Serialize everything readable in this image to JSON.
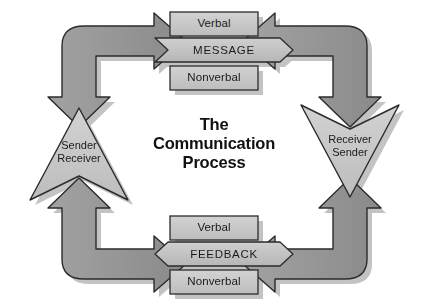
{
  "diagram": {
    "title_lines": [
      "The",
      "Communication",
      "Process"
    ],
    "title_text": "The Communication Process",
    "background_color": "#ffffff",
    "palette": {
      "light_fill": "#c9c9c9",
      "mid_fill": "#bdbdbd",
      "dark_fill": "#949494",
      "outline": "#2b2b2b",
      "shadow": "#b8b8b8",
      "text": "#1a1a1a"
    },
    "message_block": {
      "top_label": "Verbal",
      "band_label": "MESSAGE",
      "bottom_label": "Nonverbal",
      "direction": "right"
    },
    "feedback_block": {
      "top_label": "Verbal",
      "band_label": "FEEDBACK",
      "bottom_label": "Nonverbal",
      "direction": "left"
    },
    "left_node": {
      "line1": "Sender",
      "line2": "Receiver",
      "shape": "triangle-up"
    },
    "right_node": {
      "line1": "Receiver",
      "line2": "Sender",
      "shape": "triangle-down"
    },
    "connectors": [
      {
        "name": "bottom-left-elbow",
        "from": "feedback",
        "to": "sender-receiver",
        "direction": "up"
      },
      {
        "name": "top-left-elbow",
        "from": "sender-receiver",
        "to": "message",
        "direction": "right"
      },
      {
        "name": "top-right-elbow",
        "from": "message",
        "to": "receiver-sender",
        "direction": "down"
      },
      {
        "name": "bottom-right-elbow",
        "from": "receiver-sender",
        "to": "feedback",
        "direction": "left"
      }
    ]
  }
}
